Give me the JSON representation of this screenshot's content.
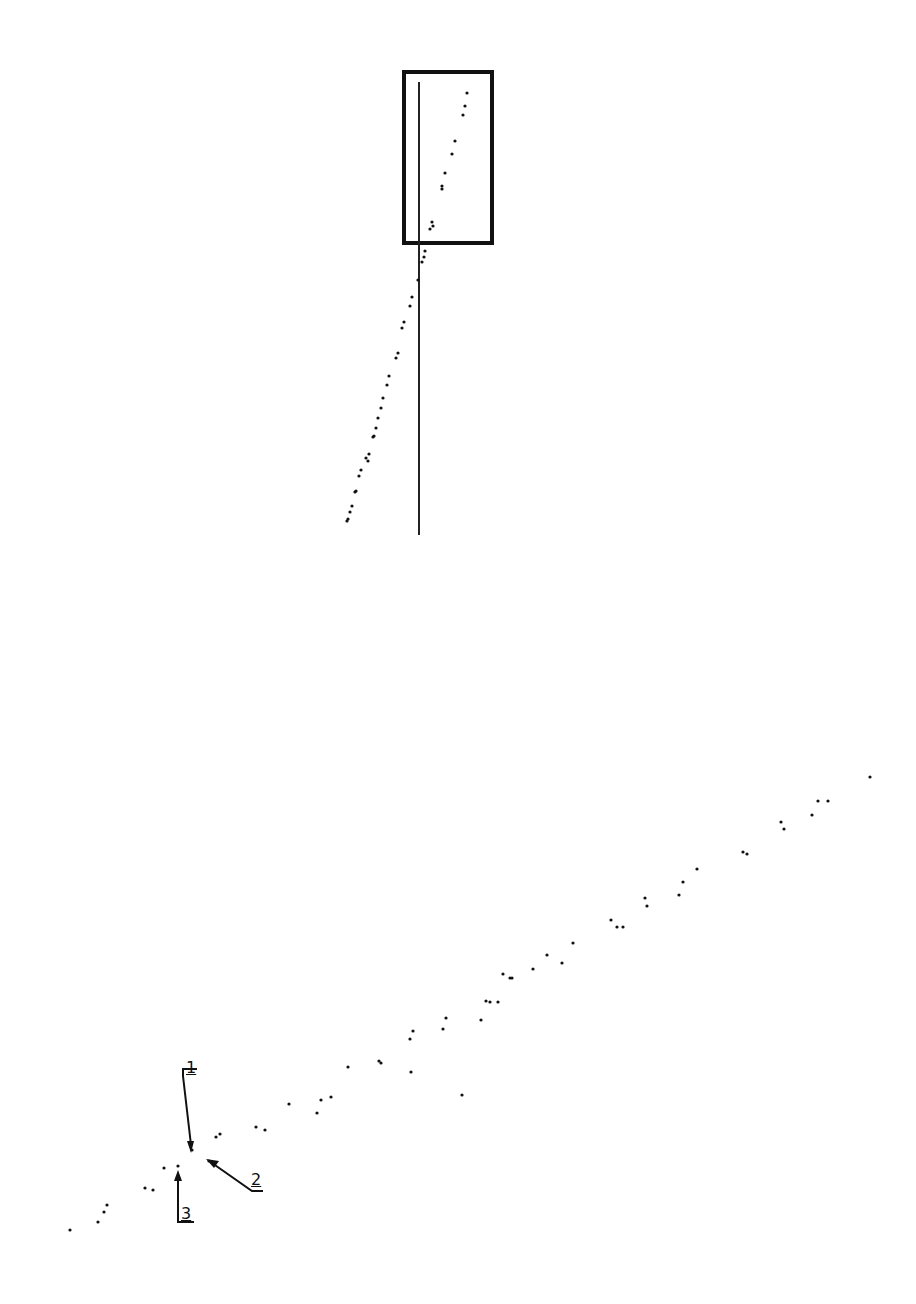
{
  "figure": {
    "top_panel": {
      "frame": {
        "x": 404,
        "y": 72,
        "w": 88,
        "h": 171
      },
      "vertical_line": {
        "x": 419,
        "y1": 82,
        "y2": 535
      },
      "dots": [
        [
          467,
          93
        ],
        [
          465,
          106
        ],
        [
          463,
          115
        ],
        [
          455,
          141
        ],
        [
          452,
          154
        ],
        [
          445,
          173
        ],
        [
          442,
          186
        ],
        [
          442,
          189
        ],
        [
          432,
          222
        ],
        [
          433,
          226
        ],
        [
          430,
          229
        ],
        [
          425,
          251
        ],
        [
          424,
          257
        ],
        [
          422,
          262
        ],
        [
          418,
          280
        ],
        [
          412,
          297
        ],
        [
          410,
          306
        ],
        [
          404,
          322
        ],
        [
          402,
          328
        ],
        [
          398,
          353
        ],
        [
          396,
          358
        ],
        [
          389,
          376
        ],
        [
          387,
          385
        ],
        [
          383,
          398
        ],
        [
          381,
          408
        ],
        [
          378,
          418
        ],
        [
          376,
          428
        ],
        [
          374,
          436
        ],
        [
          373,
          437
        ],
        [
          369,
          454
        ],
        [
          366,
          458
        ],
        [
          368,
          461
        ],
        [
          361,
          470
        ],
        [
          359,
          476
        ],
        [
          356,
          491
        ],
        [
          355,
          492
        ],
        [
          352,
          506
        ],
        [
          350,
          512
        ],
        [
          348,
          519
        ],
        [
          347,
          521
        ]
      ]
    },
    "bottom_panel": {
      "dots": [
        [
          70,
          1230
        ],
        [
          98,
          1222
        ],
        [
          104,
          1212
        ],
        [
          107,
          1205
        ],
        [
          145,
          1188
        ],
        [
          153,
          1190
        ],
        [
          164,
          1168
        ],
        [
          178,
          1166
        ],
        [
          192,
          1150
        ],
        [
          209,
          1161
        ],
        [
          216,
          1137
        ],
        [
          220,
          1134
        ],
        [
          256,
          1127
        ],
        [
          265,
          1130
        ],
        [
          289,
          1104
        ],
        [
          317,
          1113
        ],
        [
          321,
          1100
        ],
        [
          331,
          1097
        ],
        [
          348,
          1067
        ],
        [
          381,
          1063
        ],
        [
          379,
          1061
        ],
        [
          411,
          1072
        ],
        [
          410,
          1039
        ],
        [
          413,
          1031
        ],
        [
          443,
          1029
        ],
        [
          446,
          1018
        ],
        [
          481,
          1020
        ],
        [
          486,
          1001
        ],
        [
          490,
          1002
        ],
        [
          498,
          1002
        ],
        [
          503,
          974
        ],
        [
          510,
          978
        ],
        [
          512,
          978
        ],
        [
          533,
          969
        ],
        [
          547,
          955
        ],
        [
          562,
          963
        ],
        [
          573,
          943
        ],
        [
          611,
          920
        ],
        [
          617,
          927
        ],
        [
          623,
          927
        ],
        [
          645,
          898
        ],
        [
          647,
          906
        ],
        [
          679,
          895
        ],
        [
          683,
          882
        ],
        [
          697,
          869
        ],
        [
          747,
          854
        ],
        [
          743,
          852
        ],
        [
          781,
          822
        ],
        [
          784,
          829
        ],
        [
          812,
          815
        ],
        [
          818,
          801
        ],
        [
          828,
          801
        ],
        [
          870,
          777
        ],
        [
          462,
          1095
        ]
      ],
      "callouts": [
        {
          "label": "1",
          "text_x": 189,
          "text_y": 1068
        },
        {
          "label": "2",
          "text_x": 254,
          "text_y": 1178
        },
        {
          "label": "3",
          "text_x": 180,
          "text_y": 1208
        }
      ]
    }
  },
  "style": {
    "ink": "#111111",
    "background": "#ffffff"
  }
}
